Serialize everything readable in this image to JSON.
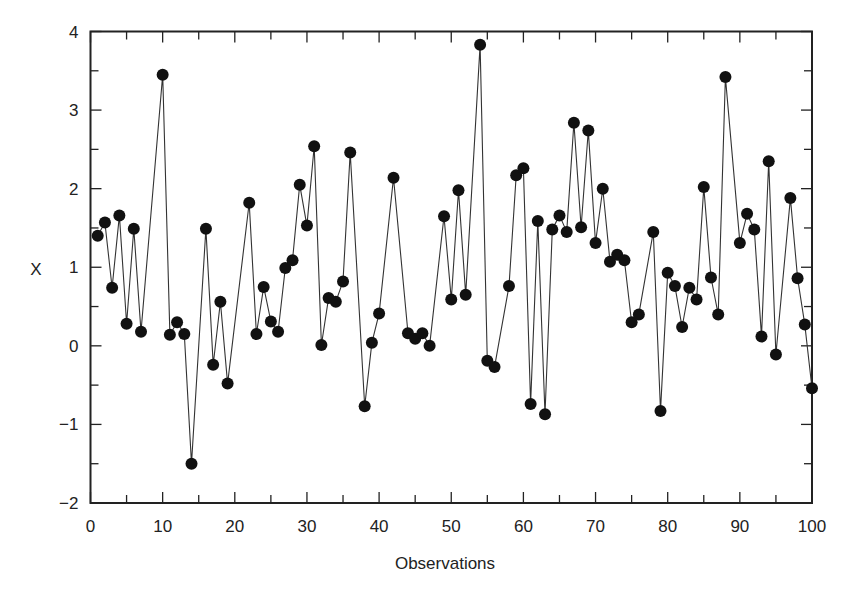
{
  "chart_data": {
    "type": "line",
    "title": "",
    "xlabel": "Observations",
    "ylabel": "X",
    "xlim": [
      0,
      100
    ],
    "ylim": [
      -2,
      4
    ],
    "x_ticks": [
      0,
      10,
      20,
      30,
      40,
      50,
      60,
      70,
      80,
      90,
      100
    ],
    "x_minor_ticks": [
      5,
      15,
      25,
      35,
      45,
      55,
      65,
      75,
      85,
      95
    ],
    "y_ticks": [
      -2,
      -1,
      0,
      1,
      2,
      3,
      4
    ],
    "y_minor_ticks": [
      -1.5,
      -0.5,
      0.5,
      1.5,
      2.5,
      3.5
    ],
    "grid": false,
    "legend": null,
    "marker": "filled-circle",
    "line_color": "#333333",
    "marker_color": "#111111",
    "series": [
      {
        "name": "X",
        "x": [
          1,
          2,
          3,
          4,
          5,
          6,
          7,
          10,
          11,
          12,
          13,
          14,
          16,
          17,
          18,
          19,
          22,
          23,
          24,
          25,
          26,
          27,
          28,
          29,
          30,
          31,
          32,
          33,
          34,
          35,
          36,
          38,
          39,
          40,
          42,
          44,
          45,
          46,
          47,
          49,
          50,
          51,
          52,
          54,
          55,
          56,
          58,
          59,
          60,
          61,
          62,
          63,
          64,
          65,
          66,
          67,
          68,
          69,
          70,
          71,
          72,
          73,
          74,
          75,
          76,
          78,
          79,
          80,
          81,
          82,
          83,
          84,
          85,
          86,
          87,
          88,
          90,
          91,
          92,
          93,
          94,
          95,
          97,
          98,
          99,
          100
        ],
        "values": [
          1.4,
          1.57,
          0.74,
          1.66,
          0.28,
          1.49,
          0.18,
          3.45,
          0.14,
          0.3,
          0.15,
          -1.5,
          1.49,
          -0.24,
          0.56,
          -0.48,
          1.82,
          0.15,
          0.75,
          0.31,
          0.18,
          0.99,
          1.09,
          2.05,
          1.53,
          2.54,
          0.01,
          0.61,
          0.56,
          0.82,
          2.46,
          -0.77,
          0.04,
          0.41,
          2.14,
          0.16,
          0.09,
          0.16,
          0.0,
          1.65,
          0.59,
          1.98,
          0.65,
          3.83,
          -0.19,
          -0.27,
          0.76,
          2.17,
          2.26,
          -0.74,
          1.59,
          -0.87,
          1.48,
          1.66,
          1.45,
          2.84,
          1.51,
          2.74,
          1.31,
          2.0,
          1.07,
          1.16,
          1.09,
          0.3,
          0.4,
          1.45,
          -0.83,
          0.93,
          0.76,
          0.24,
          0.74,
          0.59,
          2.02,
          0.87,
          0.4,
          3.42,
          1.31,
          1.68,
          1.48,
          0.12,
          2.35,
          -0.11,
          1.88,
          0.86,
          0.27,
          -0.54
        ]
      }
    ]
  },
  "labels": {
    "xlabel": "Observations",
    "ylabel": "X"
  }
}
